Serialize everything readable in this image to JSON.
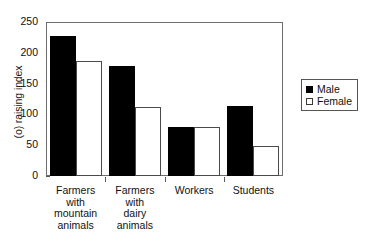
{
  "chart_data": {
    "type": "bar",
    "title": "",
    "subtitle": "",
    "xlabel": "",
    "ylabel": "(o) raising index",
    "ylim": [
      0,
      250
    ],
    "yticks": [
      0,
      50,
      100,
      150,
      200,
      250
    ],
    "grid": false,
    "legend_position": "right",
    "categories": [
      "Farmers with mountain animals",
      "Farmers with dairy animals",
      "Workers",
      "Students"
    ],
    "category_lines": [
      [
        "Farmers",
        "with",
        "mountain",
        "animals"
      ],
      [
        "Farmers",
        "with",
        "dairy",
        "animals"
      ],
      [
        "Workers"
      ],
      [
        "Students"
      ]
    ],
    "series": [
      {
        "name": "Male",
        "color": "#000000",
        "values": [
          227,
          178,
          79,
          114
        ]
      },
      {
        "name": "Female",
        "color": "#ffffff",
        "values": [
          186,
          112,
          79,
          48
        ]
      }
    ]
  },
  "legend": {
    "items": [
      {
        "label": "Male",
        "swatch": "filled-square-icon"
      },
      {
        "label": "Female",
        "swatch": "open-square-icon"
      }
    ]
  },
  "axis": {
    "y_title": "(o) raising index",
    "y_tick_labels": [
      "250",
      "200",
      "150",
      "100",
      "50",
      "0"
    ]
  }
}
